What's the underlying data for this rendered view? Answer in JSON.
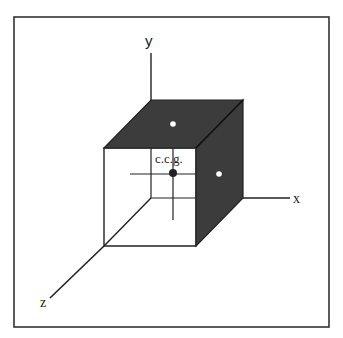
{
  "diagram": {
    "axes": {
      "x_label": "x",
      "y_label": "y",
      "z_label": "z"
    },
    "center_label": "c.c.g.",
    "colors": {
      "frame": "#333333",
      "shaded_face": "#3c3c3c",
      "line": "#222222",
      "background": "#ffffff",
      "marker_white": "#ffffff"
    },
    "markers": [
      {
        "name": "center-point",
        "fill": "dark"
      },
      {
        "name": "top-face-point",
        "fill": "white"
      },
      {
        "name": "right-face-point",
        "fill": "white"
      }
    ]
  }
}
